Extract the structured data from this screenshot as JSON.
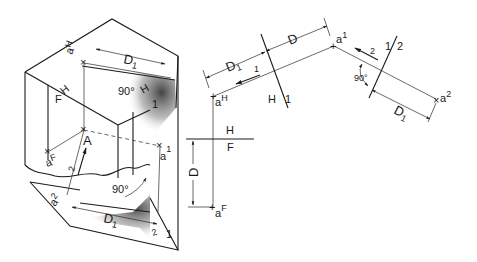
{
  "figure": {
    "pictorial": {
      "labels": {
        "aH": "a",
        "aH_sup": "H",
        "D1_top": "D",
        "D1_top_sub": "1",
        "angle_top": "90°",
        "H": "H",
        "one_top": "1",
        "F": "F",
        "A": "A",
        "aF": "a",
        "aF_sup": "F",
        "a1": "a",
        "a1_sup": "1",
        "two_left": "2",
        "angle_bottom": "90°",
        "a2": "a",
        "a2_sup": "2",
        "D1_bottom": "D",
        "D1_bottom_sub": "1",
        "two_right": "2",
        "one_right": "1"
      }
    },
    "orthographic": {
      "labels": {
        "D1": "D",
        "D1_sub": "1",
        "D": "D",
        "a1": "a",
        "a1_sup": "1",
        "line_of_sight_1": "1",
        "aH": "a",
        "aH_sup": "H",
        "fold_H1_H": "H",
        "fold_H1_1": "1",
        "fold_12_1": "1",
        "fold_12_2": "2",
        "line_of_sight_2": "2",
        "angle": "90°",
        "D1_right": "D",
        "D1_right_sub": "1",
        "a2": "a",
        "a2_sup": "2",
        "fold_HF_H": "H",
        "fold_HF_F": "F",
        "D_vertical": "D",
        "aF": "a",
        "aF_sup": "F"
      }
    }
  }
}
